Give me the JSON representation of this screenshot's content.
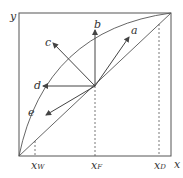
{
  "axes": {
    "y_label": "y",
    "x_label": "x"
  },
  "x_ticks": [
    {
      "main": "x",
      "sub": "W"
    },
    {
      "main": "x",
      "sub": "F"
    },
    {
      "main": "x",
      "sub": "D"
    }
  ],
  "arrows": [
    "a",
    "b",
    "c",
    "d",
    "e"
  ],
  "colors": {
    "line": "#444444",
    "background": "#ffffff"
  }
}
